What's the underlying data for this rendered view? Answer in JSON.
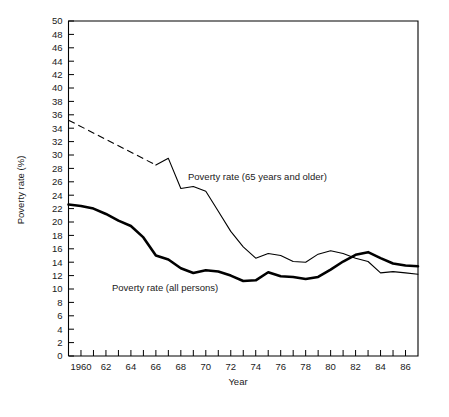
{
  "chart_data": {
    "type": "line",
    "title": "",
    "xlabel": "Year",
    "ylabel": "Poverty rate (%)",
    "xlim": [
      1959,
      1987
    ],
    "ylim": [
      0,
      50
    ],
    "grid": false,
    "legend_position": "inline-annotation",
    "y_ticks": [
      0,
      2,
      4,
      6,
      8,
      10,
      12,
      14,
      16,
      18,
      20,
      22,
      24,
      26,
      28,
      30,
      32,
      34,
      36,
      38,
      40,
      42,
      44,
      46,
      48,
      50
    ],
    "y_tick_labels": [
      "0",
      "2",
      "4",
      "6",
      "8",
      "10",
      "12",
      "14",
      "16",
      "18",
      "20",
      "22",
      "24",
      "26",
      "28",
      "30",
      "32",
      "34",
      "36",
      "38",
      "40",
      "42",
      "44",
      "46",
      "48",
      "50"
    ],
    "x_ticks": [
      1960,
      1961,
      1962,
      1963,
      1964,
      1965,
      1966,
      1967,
      1968,
      1969,
      1970,
      1971,
      1972,
      1973,
      1974,
      1975,
      1976,
      1977,
      1978,
      1979,
      1980,
      1981,
      1982,
      1983,
      1984,
      1985,
      1986
    ],
    "x_tick_labels": [
      "1960",
      "",
      "62",
      "",
      "64",
      "",
      "66",
      "",
      "68",
      "",
      "70",
      "",
      "72",
      "",
      "74",
      "",
      "76",
      "",
      "78",
      "",
      "80",
      "",
      "82",
      "",
      "84",
      "",
      "86"
    ],
    "series": [
      {
        "name": "Poverty rate (65 years and older)",
        "label_text": "Poverty rate (65 years and older)",
        "style": "thin",
        "x": [
          1959,
          1966,
          1967,
          1968,
          1969,
          1970,
          1971,
          1972,
          1973,
          1974,
          1975,
          1976,
          1977,
          1978,
          1979,
          1980,
          1981,
          1982,
          1983,
          1984,
          1985,
          1986,
          1987
        ],
        "values": [
          35.2,
          28.5,
          29.5,
          25.0,
          25.3,
          24.6,
          21.6,
          18.6,
          16.3,
          14.6,
          15.3,
          15.0,
          14.1,
          14.0,
          15.2,
          15.7,
          15.3,
          14.6,
          14.1,
          12.4,
          12.6,
          12.4,
          12.2
        ],
        "dashed_segment": {
          "from_year": 1959,
          "to_year": 1966,
          "note": "dashed interpolation between 1959 and 1966"
        }
      },
      {
        "name": "Poverty rate (all persons)",
        "label_text": "Poverty rate (all persons)",
        "style": "thick",
        "x": [
          1959,
          1960,
          1961,
          1962,
          1963,
          1964,
          1965,
          1966,
          1967,
          1968,
          1969,
          1970,
          1971,
          1972,
          1973,
          1974,
          1975,
          1976,
          1977,
          1978,
          1979,
          1980,
          1981,
          1982,
          1983,
          1984,
          1985,
          1986,
          1987
        ],
        "values": [
          22.6,
          22.4,
          22.0,
          21.2,
          20.2,
          19.4,
          17.7,
          15.0,
          14.4,
          13.1,
          12.4,
          12.8,
          12.6,
          12.0,
          11.2,
          11.3,
          12.5,
          11.9,
          11.8,
          11.5,
          11.8,
          12.9,
          14.1,
          15.1,
          15.5,
          14.6,
          13.8,
          13.5,
          13.4
        ]
      }
    ],
    "annotations": [
      {
        "text": "Poverty rate (65 years and older)",
        "x_px": 188,
        "y_px": 180
      },
      {
        "text": "Poverty rate (all persons)",
        "x_px": 112,
        "y_px": 291
      }
    ]
  },
  "axes": {
    "y_title": "Poverty rate (%)",
    "x_title": "Year"
  }
}
